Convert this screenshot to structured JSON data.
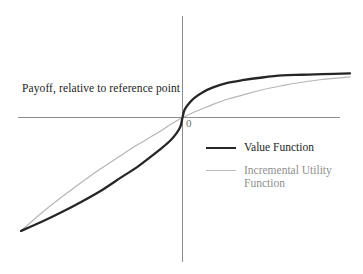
{
  "figure": {
    "background_color": "#ffffff",
    "width": 363,
    "height": 274
  },
  "axes": {
    "origin_label": "0",
    "y_axis_label": "Payoff, relative to reference point",
    "axis_color": "#8d8d8d",
    "x_axis_y": 117,
    "y_axis_x": 182,
    "x_axis_start": 18,
    "x_axis_end": 340,
    "y_axis_start": 16,
    "y_axis_end": 262
  },
  "legend": {
    "items": [
      {
        "label": "Value Function",
        "color": "#262626",
        "style": "thick",
        "text_tone": "dark"
      },
      {
        "label": "Incremental Utility\nFunction",
        "color": "#bcbcbc",
        "style": "thin",
        "text_tone": "gray"
      }
    ]
  },
  "chart_data": {
    "type": "line",
    "title": "",
    "xlabel": "",
    "ylabel": "Payoff, relative to reference point",
    "grid": false,
    "legend_position": "center-right",
    "axis_origin_label": "0",
    "xlim": [
      -160,
      168
    ],
    "ylim": [
      -145,
      101
    ],
    "series": [
      {
        "name": "Value Function",
        "color": "#262626",
        "linewidth": 2.3,
        "x": [
          -160,
          -140,
          -120,
          -100,
          -80,
          -60,
          -45,
          -30,
          -20,
          -12,
          -6,
          -2,
          0,
          2,
          6,
          12,
          20,
          30,
          45,
          60,
          80,
          100,
          120,
          140,
          168
        ],
        "y": [
          -128,
          -118,
          -107,
          -95,
          -82,
          -67,
          -56,
          -43,
          -34,
          -26,
          -18,
          -10,
          0,
          11,
          20,
          29,
          37,
          44,
          51,
          55,
          59,
          62,
          63,
          64,
          65
        ]
      },
      {
        "name": "Incremental Utility Function",
        "color": "#bcbcbc",
        "linewidth": 1.15,
        "x": [
          -160,
          -140,
          -120,
          -100,
          -80,
          -60,
          -45,
          -30,
          -20,
          -12,
          -6,
          -2,
          0,
          2,
          6,
          12,
          20,
          30,
          45,
          60,
          80,
          100,
          120,
          140,
          168
        ],
        "y": [
          -128,
          -108,
          -90,
          -73,
          -57,
          -42,
          -31,
          -21,
          -14,
          -8,
          -4,
          -1,
          0,
          1,
          4,
          8,
          13,
          19,
          27,
          33,
          41,
          47,
          52,
          56,
          60
        ]
      }
    ]
  }
}
